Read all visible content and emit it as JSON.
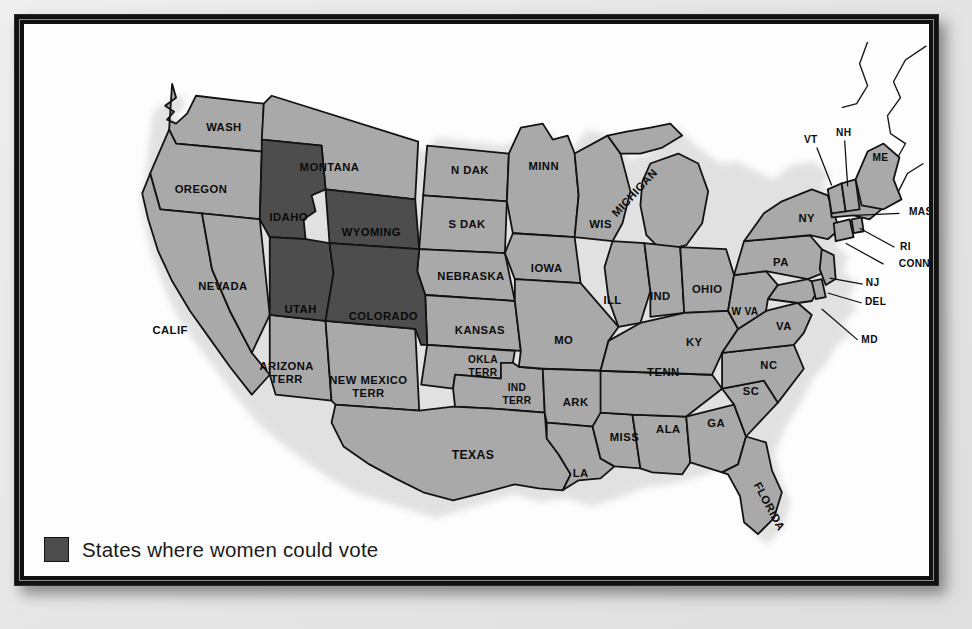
{
  "legend": {
    "swatch_color": "#4d4d4d",
    "label": "States where women could vote"
  },
  "map": {
    "title": "United States map showing states where women could vote",
    "colors": {
      "suffrage_fill": "#4d4d4d",
      "non_suffrage_fill": "#a9a9a9",
      "outline": "#121212",
      "shadow": "#b9b9b9",
      "panel_background": "#fdfdfd",
      "frame": "#111111",
      "page_background": "#e9e9e9"
    },
    "suffrage_states": [
      "IDAHO",
      "WYOMING",
      "UTAH",
      "COLORADO"
    ],
    "labels": [
      {
        "text": "WASH",
        "x": 200,
        "y": 107,
        "cls": "lbl"
      },
      {
        "text": "OREGON",
        "x": 177,
        "y": 170,
        "cls": "lbl"
      },
      {
        "text": "IDAHO",
        "x": 265,
        "y": 198,
        "cls": "lbl onDark"
      },
      {
        "text": "MONTANA",
        "x": 306,
        "y": 148,
        "cls": "lbl"
      },
      {
        "text": "WYOMING",
        "x": 348,
        "y": 213,
        "cls": "lbl onDark"
      },
      {
        "text": "N DAK",
        "x": 447,
        "y": 151,
        "cls": "lbl"
      },
      {
        "text": "MINN",
        "x": 521,
        "y": 147,
        "cls": "lbl"
      },
      {
        "text": "S DAK",
        "x": 444,
        "y": 205,
        "cls": "lbl"
      },
      {
        "text": "NEBRASKA",
        "x": 448,
        "y": 257,
        "cls": "lbl"
      },
      {
        "text": "IOWA",
        "x": 524,
        "y": 249,
        "cls": "lbl"
      },
      {
        "text": "WIS",
        "x": 578,
        "y": 205,
        "cls": "lbl"
      },
      {
        "text": "MICHIGAN",
        "x": 615,
        "y": 172,
        "cls": "lbl",
        "rotate": -47
      },
      {
        "text": "NEVADA",
        "x": 199,
        "y": 267,
        "cls": "lbl"
      },
      {
        "text": "CALIF",
        "x": 146,
        "y": 311,
        "cls": "lbl"
      },
      {
        "text": "UTAH",
        "x": 277,
        "y": 290,
        "cls": "lbl onDark"
      },
      {
        "text": "COLORADO",
        "x": 360,
        "y": 297,
        "cls": "lbl onDark"
      },
      {
        "text": "KANSAS",
        "x": 457,
        "y": 311,
        "cls": "lbl"
      },
      {
        "text": "MO",
        "x": 541,
        "y": 321,
        "cls": "lbl"
      },
      {
        "text": "ILL",
        "x": 590,
        "y": 281,
        "cls": "lbl"
      },
      {
        "text": "IND",
        "x": 638,
        "y": 277,
        "cls": "lbl"
      },
      {
        "text": "OHIO",
        "x": 685,
        "y": 270,
        "cls": "lbl"
      },
      {
        "text": "KY",
        "x": 672,
        "y": 323,
        "cls": "lbl"
      },
      {
        "text": "TENN",
        "x": 641,
        "y": 353,
        "cls": "lbl"
      },
      {
        "text": "ARK",
        "x": 553,
        "y": 383,
        "cls": "lbl"
      },
      {
        "text": "MISS",
        "x": 602,
        "y": 419,
        "cls": "lbl"
      },
      {
        "text": "ALA",
        "x": 646,
        "y": 410,
        "cls": "lbl"
      },
      {
        "text": "GA",
        "x": 694,
        "y": 404,
        "cls": "lbl"
      },
      {
        "text": "SC",
        "x": 729,
        "y": 372,
        "cls": "lbl"
      },
      {
        "text": "NC",
        "x": 747,
        "y": 346,
        "cls": "lbl"
      },
      {
        "text": "W VA",
        "x": 723,
        "y": 292,
        "cls": "lbl sm"
      },
      {
        "text": "VA",
        "x": 762,
        "y": 307,
        "cls": "lbl"
      },
      {
        "text": "PA",
        "x": 759,
        "y": 243,
        "cls": "lbl"
      },
      {
        "text": "NY",
        "x": 785,
        "y": 199,
        "cls": "lbl"
      },
      {
        "text": "LA",
        "x": 558,
        "y": 455,
        "cls": "lbl"
      },
      {
        "text": "TEXAS",
        "x": 450,
        "y": 437,
        "cls": "lbl lg"
      },
      {
        "text": "FLORIDA",
        "x": 744,
        "y": 486,
        "cls": "lbl",
        "rotate": 62
      }
    ],
    "multiline_labels": [
      {
        "lines": [
          "ARIZONA",
          "TERR"
        ],
        "x": 263,
        "y": 354,
        "cls": "lbl"
      },
      {
        "lines": [
          "NEW MEXICO",
          "TERR"
        ],
        "x": 345,
        "y": 368,
        "cls": "lbl"
      },
      {
        "lines": [
          "OKLA",
          "TERR"
        ],
        "x": 460,
        "y": 347,
        "cls": "lbl sm"
      },
      {
        "lines": [
          "IND",
          "TERR"
        ],
        "x": 494,
        "y": 375,
        "cls": "lbl sm"
      }
    ],
    "leader_labels": [
      {
        "text": "VT",
        "x": 789,
        "y": 119,
        "cls": "lbl sm",
        "anchor": "middle",
        "line": [
          [
            795,
            124
          ],
          [
            810,
            162
          ]
        ]
      },
      {
        "text": "NH",
        "x": 822,
        "y": 112,
        "cls": "lbl sm",
        "anchor": "middle",
        "line": [
          [
            823,
            117
          ],
          [
            826,
            163
          ]
        ]
      },
      {
        "text": "ME",
        "x": 859,
        "y": 137,
        "cls": "lbl sm",
        "anchor": "middle",
        "line": null
      },
      {
        "text": "MASS",
        "x": 903,
        "y": 192,
        "cls": "lbl sm",
        "anchor": "middle",
        "line": [
          [
            878,
            190
          ],
          [
            833,
            192
          ]
        ]
      },
      {
        "text": "RI",
        "x": 884,
        "y": 227,
        "cls": "lbl sm",
        "anchor": "middle",
        "line": [
          [
            873,
            224
          ],
          [
            838,
            205
          ]
        ]
      },
      {
        "text": "CONN",
        "x": 893,
        "y": 244,
        "cls": "lbl sm",
        "anchor": "middle",
        "line": [
          [
            862,
            241
          ],
          [
            824,
            220
          ]
        ]
      },
      {
        "text": "NJ",
        "x": 851,
        "y": 263,
        "cls": "lbl sm",
        "anchor": "middle",
        "line": [
          [
            841,
            261
          ],
          [
            808,
            255
          ]
        ]
      },
      {
        "text": "DEL",
        "x": 854,
        "y": 282,
        "cls": "lbl sm",
        "anchor": "middle",
        "line": [
          [
            840,
            280
          ],
          [
            806,
            270
          ]
        ]
      },
      {
        "text": "MD",
        "x": 848,
        "y": 320,
        "cls": "lbl sm",
        "anchor": "middle",
        "line": [
          [
            836,
            317
          ],
          [
            800,
            286
          ]
        ]
      }
    ]
  }
}
